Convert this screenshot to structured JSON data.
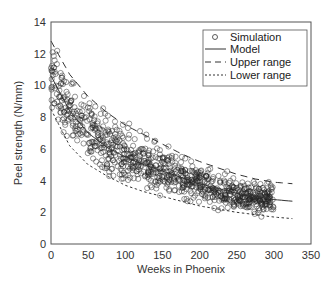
{
  "chart_data": {
    "type": "scatter",
    "title": "",
    "xlabel": "Weeks in Phoenix",
    "ylabel": "Peel strength (N/mm)",
    "xlim": [
      0,
      350
    ],
    "ylim": [
      0,
      14
    ],
    "xticks": [
      0,
      50,
      100,
      150,
      200,
      250,
      300,
      350
    ],
    "yticks": [
      0,
      2,
      4,
      6,
      8,
      10,
      12,
      14
    ],
    "grid": false,
    "legend_position": "upper right",
    "legend": [
      "Simulation",
      "Model",
      "Upper range",
      "Lower range"
    ],
    "x": [
      0,
      25,
      50,
      75,
      100,
      125,
      150,
      175,
      200,
      225,
      250,
      275,
      300,
      325
    ],
    "series": [
      {
        "name": "Model",
        "style": "solid",
        "values": [
          10.6,
          8.4,
          7.0,
          6.1,
          5.5,
          5.0,
          4.6,
          4.2,
          3.8,
          3.5,
          3.2,
          3.0,
          2.8,
          2.7
        ]
      },
      {
        "name": "Upper range",
        "style": "long-dash",
        "values": [
          12.8,
          10.7,
          9.3,
          8.3,
          7.5,
          6.9,
          6.3,
          5.7,
          5.2,
          4.8,
          4.4,
          4.1,
          3.9,
          3.8
        ]
      },
      {
        "name": "Lower range",
        "style": "short-dash",
        "values": [
          8.5,
          6.2,
          5.0,
          4.3,
          3.7,
          3.3,
          3.0,
          2.7,
          2.4,
          2.2,
          2.0,
          1.85,
          1.7,
          1.6
        ]
      }
    ],
    "simulation": {
      "name": "Simulation",
      "marker": "open-circle",
      "x_range": [
        0,
        300
      ],
      "count": 900,
      "description": "Scattered simulated points clustered around the model curve, mostly within the upper/lower range band"
    }
  }
}
